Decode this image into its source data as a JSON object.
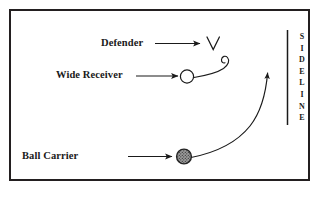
{
  "diagram": {
    "background_color": "#ffffff",
    "border_color": "#231f20",
    "ink_color": "#1a1a1a"
  },
  "labels": {
    "defender": "Defender",
    "wide_receiver": "Wide Receiver",
    "ball_carrier": "Ball Carrier"
  },
  "sideline": {
    "text": "SIDELINE",
    "letters": [
      "S",
      "I",
      "D",
      "E",
      "L",
      "I",
      "N",
      "E"
    ]
  },
  "markers": {
    "defender_symbol": "V",
    "wide_receiver_symbol": "open-circle",
    "ball_carrier_symbol": "filled-stippled-circle",
    "ball_carrier_fill": "#8c8c8c"
  }
}
